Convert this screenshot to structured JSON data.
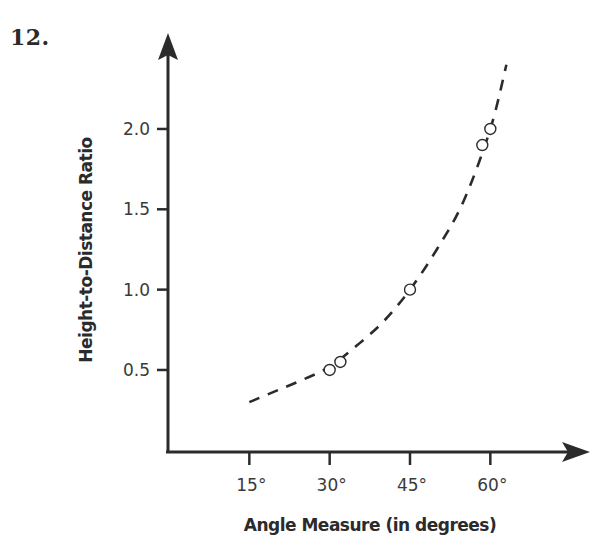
{
  "problem": {
    "number": "12."
  },
  "chart_data": {
    "type": "scatter",
    "title": "",
    "xlabel": "Angle Measure (in degrees)",
    "ylabel": "Height-to-Distance Ratio",
    "x_ticks": [
      15,
      30,
      45,
      60
    ],
    "x_tick_labels": [
      "15°",
      "30°",
      "45°",
      "60°"
    ],
    "y_ticks": [
      0.5,
      1.0,
      1.5,
      2.0
    ],
    "y_tick_labels": [
      "0.5",
      "1.0",
      "1.5",
      "2.0"
    ],
    "xlim": [
      0,
      78
    ],
    "ylim": [
      0,
      2.6
    ],
    "grid": false,
    "legend": null,
    "series": [
      {
        "name": "Measured points",
        "type": "scatter",
        "marker": "open-circle",
        "x": [
          30,
          32,
          45,
          58.5,
          60
        ],
        "y": [
          0.5,
          0.55,
          1.0,
          1.9,
          2.0
        ]
      },
      {
        "name": "Trend curve",
        "type": "line",
        "style": "dashed",
        "x": [
          15,
          20,
          25,
          30,
          35,
          40,
          45,
          50,
          55,
          60,
          63
        ],
        "y": [
          0.3,
          0.37,
          0.44,
          0.52,
          0.65,
          0.8,
          1.0,
          1.25,
          1.55,
          2.0,
          2.4
        ]
      }
    ],
    "colors": {
      "axis": "#2b2b2b",
      "curve": "#2b2b2b",
      "marker_stroke": "#2b2b2b",
      "marker_fill": "#ffffff"
    }
  }
}
